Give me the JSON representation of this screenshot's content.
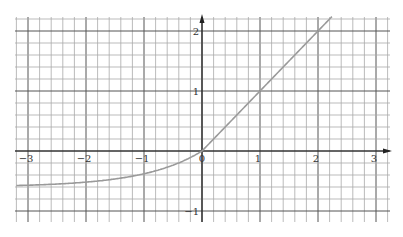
{
  "chart_data": {
    "type": "line",
    "title": "",
    "xlabel": "",
    "ylabel": "",
    "function": "ELU: y = x for x >= 0, y = 0.6*(e^x - 1) for x < 0",
    "xlim": [
      -3.2,
      3.25
    ],
    "ylim": [
      -1.2,
      2.25
    ],
    "grid": true,
    "grid_minor_step": 0.2,
    "x_ticks": [
      -3,
      -2,
      -1,
      0,
      1,
      2,
      3
    ],
    "x_tick_labels": [
      "−3",
      "−2",
      "−1",
      "0",
      "1",
      "2",
      "3"
    ],
    "y_ticks": [
      2,
      1,
      -1
    ],
    "y_tick_labels": [
      "2",
      "1",
      "−1"
    ],
    "series": [
      {
        "name": "ELU",
        "color": "#9a9a9a",
        "x": [
          -3.2,
          -3,
          -2.5,
          -2,
          -1.5,
          -1,
          -0.5,
          0,
          0.5,
          1,
          1.5,
          2,
          2.25
        ],
        "y": [
          -0.58,
          -0.57,
          -0.55,
          -0.52,
          -0.47,
          -0.38,
          -0.24,
          0,
          0.5,
          1,
          1.5,
          2,
          2.25
        ]
      }
    ],
    "legend": null
  }
}
